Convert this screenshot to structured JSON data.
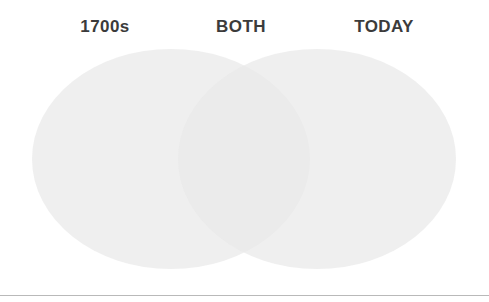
{
  "figure": {
    "type": "venn-diagram",
    "title": "",
    "background_color": "#ffffff",
    "width": 489,
    "height": 302
  },
  "labels": {
    "left": "1700s",
    "both": "BOTH",
    "right": "TODAY",
    "text_color": "#3b3b3b"
  },
  "circles": {
    "left": {
      "name": "1700s",
      "fill": "#e9e9e9",
      "center_x": 171,
      "center_y": 158,
      "width": 278,
      "height": 220
    },
    "right": {
      "name": "TODAY",
      "fill": "#e9e9e9",
      "center_x": 317,
      "center_y": 158,
      "width": 278,
      "height": 220
    },
    "overlap": {
      "name": "BOTH",
      "fill": "#e2e2e2"
    }
  },
  "divider": {
    "color": "#b9b9b9",
    "y": 295
  },
  "chart_data": {
    "type": "venn",
    "title": "",
    "sets": [
      {
        "label": "1700s",
        "position": "left",
        "items": []
      },
      {
        "label": "TODAY",
        "position": "right",
        "items": []
      }
    ],
    "intersection": {
      "label": "BOTH",
      "items": []
    },
    "legend": "none",
    "grid": false
  }
}
